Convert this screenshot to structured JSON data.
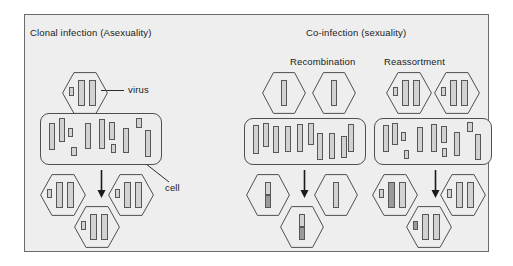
{
  "figure": {
    "background": "#eeeeee",
    "border_color": "#6b6b6b",
    "segment_fill": "#d2d2d2",
    "segment_fill_dark": "#9a9a9a",
    "segment_stroke": "#575757",
    "text_color": "#1a1a1a"
  },
  "titles": {
    "left": "Clonal infection (Asexuality)",
    "right": "Co-infection (sexuality)",
    "sub_recombination": "Recombination",
    "sub_reassortment": "Reassortment"
  },
  "callouts": {
    "virus": "virus",
    "cell": "cell"
  },
  "chart_data": {
    "type": "diagram",
    "panels": [
      {
        "name": "clonal-infection",
        "title": "Clonal infection (Asexuality)",
        "parent_viruses": 1,
        "progeny_viruses": 3,
        "genome_type": "segmented",
        "segments_per_virus": 3,
        "outcome": "identical clonal progeny"
      },
      {
        "name": "recombination",
        "title": "Recombination",
        "parent_viruses": 2,
        "progeny_viruses": 3,
        "genome_type": "single-segment",
        "segments_per_virus": 1,
        "outcome": "progeny genome is a crossover chimera of both parents"
      },
      {
        "name": "reassortment",
        "title": "Reassortment",
        "parent_viruses": 2,
        "progeny_viruses": 3,
        "genome_type": "segmented",
        "segments_per_virus": 3,
        "outcome": "progeny carry mixed whole segments from both parents"
      }
    ],
    "legend": [
      "virus",
      "cell"
    ]
  },
  "clonal": {
    "parent_hexes": [
      {
        "x": 62,
        "y": 72,
        "w": 46,
        "h": 42,
        "segments": [
          {
            "x": 7,
            "y": 15,
            "w": 5,
            "h": 9,
            "shade": "light"
          },
          {
            "x": 16,
            "y": 8,
            "w": 7,
            "h": 26,
            "shade": "light"
          },
          {
            "x": 27,
            "y": 8,
            "w": 7,
            "h": 26,
            "shade": "light"
          }
        ]
      }
    ],
    "cell": {
      "x": 40,
      "y": 113,
      "w": 122,
      "h": 52,
      "segments": [
        {
          "x": 8,
          "y": 9,
          "w": 6,
          "h": 27,
          "shade": "light"
        },
        {
          "x": 18,
          "y": 4,
          "w": 6,
          "h": 24,
          "shade": "light"
        },
        {
          "x": 27,
          "y": 14,
          "w": 5,
          "h": 9,
          "shade": "light"
        },
        {
          "x": 30,
          "y": 33,
          "w": 6,
          "h": 9,
          "shade": "light"
        },
        {
          "x": 44,
          "y": 9,
          "w": 6,
          "h": 26,
          "shade": "light"
        },
        {
          "x": 58,
          "y": 5,
          "w": 6,
          "h": 30,
          "shade": "light"
        },
        {
          "x": 68,
          "y": 8,
          "w": 6,
          "h": 18,
          "shade": "light"
        },
        {
          "x": 70,
          "y": 30,
          "w": 5,
          "h": 9,
          "shade": "light"
        },
        {
          "x": 82,
          "y": 14,
          "w": 6,
          "h": 25,
          "shade": "light"
        },
        {
          "x": 95,
          "y": 4,
          "w": 6,
          "h": 10,
          "shade": "light"
        },
        {
          "x": 104,
          "y": 16,
          "w": 6,
          "h": 27,
          "shade": "light"
        }
      ]
    },
    "arrow": {
      "x": 96,
      "y": 170,
      "h": 28
    },
    "progeny_hexes": [
      {
        "x": 40,
        "y": 174,
        "w": 46,
        "h": 42,
        "segments": [
          {
            "x": 7,
            "y": 15,
            "w": 5,
            "h": 9,
            "shade": "light"
          },
          {
            "x": 16,
            "y": 8,
            "w": 7,
            "h": 26,
            "shade": "light"
          },
          {
            "x": 27,
            "y": 8,
            "w": 7,
            "h": 26,
            "shade": "light"
          }
        ]
      },
      {
        "x": 108,
        "y": 174,
        "w": 46,
        "h": 42,
        "segments": [
          {
            "x": 7,
            "y": 15,
            "w": 5,
            "h": 9,
            "shade": "light"
          },
          {
            "x": 16,
            "y": 8,
            "w": 7,
            "h": 26,
            "shade": "light"
          },
          {
            "x": 27,
            "y": 8,
            "w": 7,
            "h": 26,
            "shade": "light"
          }
        ]
      },
      {
        "x": 74,
        "y": 206,
        "w": 46,
        "h": 42,
        "segments": [
          {
            "x": 7,
            "y": 15,
            "w": 5,
            "h": 9,
            "shade": "light"
          },
          {
            "x": 16,
            "y": 8,
            "w": 7,
            "h": 26,
            "shade": "light"
          },
          {
            "x": 27,
            "y": 8,
            "w": 7,
            "h": 26,
            "shade": "light"
          }
        ]
      }
    ]
  },
  "recombination": {
    "parent_hexes": [
      {
        "x": 262,
        "y": 72,
        "w": 44,
        "h": 42,
        "segments": [
          {
            "x": 19,
            "y": 8,
            "w": 6,
            "h": 26,
            "shade": "light"
          }
        ]
      },
      {
        "x": 312,
        "y": 72,
        "w": 44,
        "h": 42,
        "segments": [
          {
            "x": 19,
            "y": 8,
            "w": 6,
            "h": 26,
            "shade": "light"
          }
        ]
      }
    ],
    "cell": {
      "x": 244,
      "y": 118,
      "w": 122,
      "h": 47,
      "segments": [
        {
          "x": 8,
          "y": 6,
          "w": 6,
          "h": 29,
          "shade": "light"
        },
        {
          "x": 18,
          "y": 4,
          "w": 6,
          "h": 24,
          "shade": "light"
        },
        {
          "x": 28,
          "y": 7,
          "w": 6,
          "h": 27,
          "shade": "light"
        },
        {
          "x": 40,
          "y": 7,
          "w": 6,
          "h": 26,
          "shade": "light"
        },
        {
          "x": 52,
          "y": 5,
          "w": 6,
          "h": 28,
          "shade": "light"
        },
        {
          "x": 63,
          "y": 4,
          "w": 6,
          "h": 22,
          "shade": "light"
        },
        {
          "x": 72,
          "y": 14,
          "w": 6,
          "h": 27,
          "shade": "light"
        },
        {
          "x": 84,
          "y": 14,
          "w": 6,
          "h": 26,
          "shade": "light"
        },
        {
          "x": 96,
          "y": 17,
          "w": 6,
          "h": 22,
          "shade": "light"
        },
        {
          "x": 103,
          "y": 5,
          "w": 6,
          "h": 28,
          "shade": "light"
        }
      ]
    },
    "arrow": {
      "x": 299,
      "y": 170,
      "h": 28
    },
    "progeny_hexes": [
      {
        "x": 246,
        "y": 174,
        "w": 44,
        "h": 42,
        "segments": [
          {
            "x": 19,
            "y": 8,
            "w": 6,
            "h": 26,
            "shade": "split"
          }
        ]
      },
      {
        "x": 314,
        "y": 174,
        "w": 44,
        "h": 42,
        "segments": [
          {
            "x": 19,
            "y": 8,
            "w": 6,
            "h": 26,
            "shade": "light"
          }
        ]
      },
      {
        "x": 280,
        "y": 206,
        "w": 44,
        "h": 42,
        "segments": [
          {
            "x": 19,
            "y": 8,
            "w": 6,
            "h": 26,
            "shade": "split"
          }
        ]
      }
    ]
  },
  "reassortment": {
    "parent_hexes": [
      {
        "x": 386,
        "y": 72,
        "w": 46,
        "h": 42,
        "segments": [
          {
            "x": 7,
            "y": 15,
            "w": 5,
            "h": 9,
            "shade": "light"
          },
          {
            "x": 16,
            "y": 8,
            "w": 7,
            "h": 26,
            "shade": "light"
          },
          {
            "x": 27,
            "y": 8,
            "w": 7,
            "h": 26,
            "shade": "light"
          }
        ]
      },
      {
        "x": 434,
        "y": 72,
        "w": 46,
        "h": 42,
        "segments": [
          {
            "x": 7,
            "y": 15,
            "w": 5,
            "h": 9,
            "shade": "light"
          },
          {
            "x": 16,
            "y": 8,
            "w": 7,
            "h": 26,
            "shade": "light"
          },
          {
            "x": 27,
            "y": 8,
            "w": 7,
            "h": 26,
            "shade": "light"
          }
        ]
      }
    ],
    "cell": {
      "x": 374,
      "y": 118,
      "w": 118,
      "h": 47,
      "segments": [
        {
          "x": 8,
          "y": 6,
          "w": 6,
          "h": 27,
          "shade": "light"
        },
        {
          "x": 17,
          "y": 4,
          "w": 6,
          "h": 22,
          "shade": "light"
        },
        {
          "x": 26,
          "y": 13,
          "w": 5,
          "h": 9,
          "shade": "light"
        },
        {
          "x": 29,
          "y": 31,
          "w": 5,
          "h": 9,
          "shade": "light"
        },
        {
          "x": 42,
          "y": 8,
          "w": 6,
          "h": 25,
          "shade": "light"
        },
        {
          "x": 56,
          "y": 5,
          "w": 6,
          "h": 28,
          "shade": "light"
        },
        {
          "x": 66,
          "y": 7,
          "w": 6,
          "h": 17,
          "shade": "light"
        },
        {
          "x": 67,
          "y": 29,
          "w": 5,
          "h": 9,
          "shade": "light"
        },
        {
          "x": 79,
          "y": 13,
          "w": 6,
          "h": 24,
          "shade": "light"
        },
        {
          "x": 92,
          "y": 3,
          "w": 6,
          "h": 10,
          "shade": "light"
        },
        {
          "x": 100,
          "y": 15,
          "w": 6,
          "h": 26,
          "shade": "light"
        }
      ]
    },
    "arrow": {
      "x": 430,
      "y": 170,
      "h": 28
    },
    "progeny_hexes": [
      {
        "x": 372,
        "y": 174,
        "w": 46,
        "h": 42,
        "segments": [
          {
            "x": 7,
            "y": 15,
            "w": 5,
            "h": 9,
            "shade": "light"
          },
          {
            "x": 16,
            "y": 8,
            "w": 7,
            "h": 26,
            "shade": "dark"
          },
          {
            "x": 27,
            "y": 8,
            "w": 7,
            "h": 26,
            "shade": "light"
          }
        ]
      },
      {
        "x": 440,
        "y": 174,
        "w": 46,
        "h": 42,
        "segments": [
          {
            "x": 7,
            "y": 15,
            "w": 5,
            "h": 9,
            "shade": "light"
          },
          {
            "x": 16,
            "y": 8,
            "w": 7,
            "h": 26,
            "shade": "light"
          },
          {
            "x": 27,
            "y": 8,
            "w": 7,
            "h": 26,
            "shade": "light"
          }
        ]
      },
      {
        "x": 406,
        "y": 206,
        "w": 46,
        "h": 42,
        "segments": [
          {
            "x": 7,
            "y": 15,
            "w": 5,
            "h": 9,
            "shade": "dark"
          },
          {
            "x": 16,
            "y": 8,
            "w": 7,
            "h": 26,
            "shade": "light"
          },
          {
            "x": 27,
            "y": 8,
            "w": 7,
            "h": 26,
            "shade": "light"
          }
        ]
      }
    ]
  }
}
